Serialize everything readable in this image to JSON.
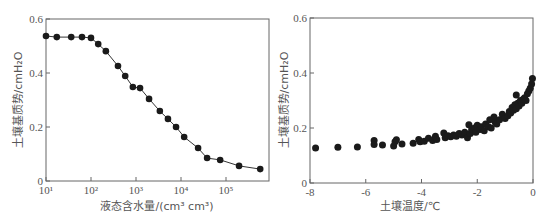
{
  "chart_data": [
    {
      "type": "line",
      "title": "",
      "xlabel": "液态含水量/(cm³ cm³)",
      "ylabel": "土壤基质势/cmH₂O",
      "xscale": "log",
      "xlim": [
        10,
        900000
      ],
      "ylim": [
        0,
        0.6
      ],
      "xticks": [
        "10¹",
        "10²",
        "10³",
        "10⁴",
        "10⁵"
      ],
      "xtick_values": [
        10,
        100,
        1000,
        10000,
        100000
      ],
      "yticks": [
        "0",
        "0.2",
        "0.4",
        "0.6"
      ],
      "ytick_values": [
        0,
        0.2,
        0.4,
        0.6
      ],
      "grid": false,
      "legend": null,
      "series": [
        {
          "name": "measured",
          "marker": "circle",
          "line": "smooth",
          "x_log10": [
            1.0,
            1.24,
            1.56,
            1.8,
            2.0,
            2.16,
            2.33,
            2.6,
            2.76,
            2.93,
            3.09,
            3.29,
            3.53,
            3.71,
            3.89,
            4.07,
            4.38,
            4.58,
            4.87,
            5.29,
            5.76
          ],
          "values": [
            0.537,
            0.533,
            0.533,
            0.533,
            0.53,
            0.507,
            0.481,
            0.426,
            0.389,
            0.348,
            0.344,
            0.304,
            0.259,
            0.23,
            0.2,
            0.163,
            0.122,
            0.085,
            0.078,
            0.056,
            0.044
          ]
        }
      ]
    },
    {
      "type": "scatter",
      "title": "",
      "xlabel": "土壤温度/℃",
      "ylabel": "土壤基质势/cmH₂O",
      "xlim": [
        -8,
        0
      ],
      "ylim": [
        0,
        0.6
      ],
      "xticks": [
        "-8",
        "-6",
        "-4",
        "-2",
        "0"
      ],
      "xtick_values": [
        -8,
        -6,
        -4,
        -2,
        0
      ],
      "yticks": [
        "0",
        "0.2",
        "0.4",
        "0.6"
      ],
      "ytick_values": [
        0,
        0.2,
        0.4,
        0.6
      ],
      "grid": false,
      "legend": null,
      "series": [
        {
          "name": "measured",
          "marker": "circle",
          "x": [
            -7.8,
            -7.0,
            -6.3,
            -5.7,
            -5.7,
            -5.4,
            -5.0,
            -4.95,
            -4.9,
            -4.7,
            -4.3,
            -4.1,
            -4.05,
            -3.9,
            -3.75,
            -3.6,
            -3.5,
            -3.45,
            -3.2,
            -3.15,
            -3.05,
            -2.95,
            -2.85,
            -2.75,
            -2.65,
            -2.55,
            -2.45,
            -2.35,
            -2.3,
            -2.25,
            -2.2,
            -2.1,
            -2.05,
            -2.0,
            -1.9,
            -1.85,
            -1.75,
            -1.7,
            -1.6,
            -1.55,
            -1.5,
            -1.4,
            -1.35,
            -1.3,
            -1.2,
            -1.1,
            -1.0,
            -0.9,
            -0.85,
            -0.8,
            -0.75,
            -0.7,
            -0.65,
            -0.6,
            -0.6,
            -0.55,
            -0.5,
            -0.45,
            -0.4,
            -0.35,
            -0.3,
            -0.25,
            -0.2,
            -0.15,
            -0.1,
            -0.05,
            -0.02
          ],
          "values": [
            0.127,
            0.13,
            0.131,
            0.155,
            0.14,
            0.138,
            0.135,
            0.15,
            0.157,
            0.142,
            0.145,
            0.158,
            0.15,
            0.152,
            0.163,
            0.155,
            0.17,
            0.158,
            0.182,
            0.165,
            0.172,
            0.168,
            0.175,
            0.17,
            0.18,
            0.175,
            0.185,
            0.165,
            0.212,
            0.18,
            0.195,
            0.2,
            0.185,
            0.21,
            0.195,
            0.205,
            0.19,
            0.215,
            0.205,
            0.23,
            0.2,
            0.24,
            0.22,
            0.215,
            0.23,
            0.25,
            0.235,
            0.245,
            0.26,
            0.255,
            0.275,
            0.265,
            0.285,
            0.32,
            0.27,
            0.29,
            0.28,
            0.3,
            0.29,
            0.305,
            0.31,
            0.3,
            0.325,
            0.335,
            0.345,
            0.36,
            0.38
          ]
        }
      ]
    }
  ]
}
